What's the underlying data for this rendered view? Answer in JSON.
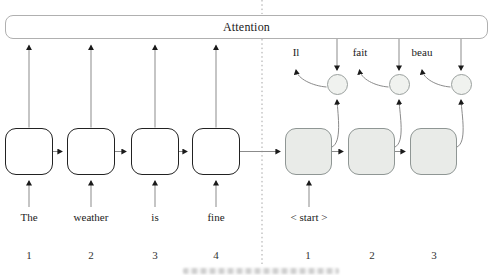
{
  "figure": {
    "type": "seq2seq-attention-diagram",
    "attention_label": "Attention",
    "encoder": {
      "inputs": [
        "The",
        "weather",
        "is",
        "fine"
      ],
      "positions": [
        "1",
        "2",
        "3",
        "4"
      ]
    },
    "decoder": {
      "start_token": "< start >",
      "outputs": [
        "Il",
        "fait",
        "beau"
      ],
      "positions": [
        "1",
        "2",
        "3"
      ]
    },
    "colors": {
      "encoder_box_border": "#222222",
      "encoder_box_fill": "#ffffff",
      "decoder_box_fill": "#e9ebe8",
      "decoder_box_border": "#8f9694",
      "circle_fill": "#f0f2ef",
      "circle_border": "#9aa09e",
      "connector_line": "#8b8b8b",
      "arrowhead": "#1a1a1a",
      "attention_bar_border": "#b0b0b0",
      "divider": "#9b9b9b"
    }
  }
}
